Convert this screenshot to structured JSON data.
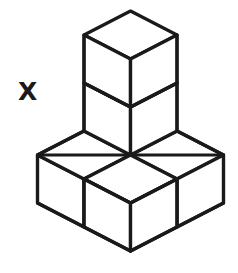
{
  "figure": {
    "label": "X",
    "cube_count": 5,
    "colors": {
      "background": "#ffffff",
      "stroke": "#1a1a1a",
      "face_fill": "#ffffff"
    },
    "geometry": {
      "origin_x": 130.5,
      "origin_y": 155.0,
      "half_width": 46.5,
      "half_depth": 24.0,
      "cube_height": 48.0
    },
    "cubes": [
      {
        "name": "base-back-left",
        "grid": [
          0,
          1,
          0
        ]
      },
      {
        "name": "base-back-right",
        "grid": [
          1,
          0,
          0
        ]
      },
      {
        "name": "base-front",
        "grid": [
          0,
          0,
          0
        ]
      },
      {
        "name": "stack-lower",
        "grid": [
          1,
          1,
          0
        ]
      },
      {
        "name": "stack-upper",
        "grid": [
          1,
          1,
          1
        ]
      }
    ]
  }
}
